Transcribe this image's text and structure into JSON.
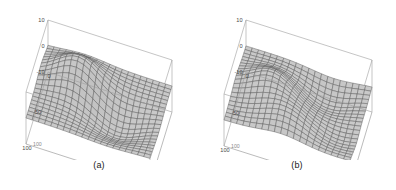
{
  "figure": {
    "background_color": "#ffffff",
    "panel_count": 2
  },
  "panels": [
    {
      "id": "a",
      "caption": "(a)",
      "box_color": "#9a9a9a",
      "mesh_line_color": "#4d4d4d",
      "mesh_fill_color": "#c9c9c9",
      "axes": {
        "z": {
          "ticks": [
            "10",
            "0",
            "-10"
          ],
          "values": [
            10,
            0,
            -10
          ]
        },
        "x": {
          "ticks": [
            "0",
            "50",
            "100"
          ],
          "values": [
            0,
            50,
            100
          ]
        },
        "y": {
          "ticks": [
            "100",
            "50",
            "0"
          ],
          "values": [
            100,
            50,
            0
          ]
        }
      }
    },
    {
      "id": "b",
      "caption": "(b)",
      "box_color": "#9a9a9a",
      "mesh_line_color": "#4d4d4d",
      "mesh_fill_color": "#c9c9c9",
      "axes": {
        "z": {
          "ticks": [
            "10",
            "0",
            "-10"
          ],
          "values": [
            10,
            0,
            -10
          ]
        },
        "x": {
          "ticks": [
            "0",
            "50",
            "100"
          ],
          "values": [
            0,
            50,
            100
          ]
        },
        "y": {
          "ticks": [
            "100",
            "50",
            "0"
          ],
          "values": [
            100,
            50,
            0
          ]
        }
      }
    }
  ],
  "chart_data": [
    {
      "type": "surface",
      "panel": "a",
      "title": "(a)",
      "xlabel": "",
      "ylabel": "",
      "zlabel": "",
      "xlim": [
        0,
        100
      ],
      "ylim": [
        0,
        100
      ],
      "zlim": [
        -10,
        10
      ],
      "xticks": [
        0,
        50,
        100
      ],
      "yticks": [
        0,
        50,
        100
      ],
      "zticks": [
        -10,
        0,
        10
      ],
      "grid": true,
      "legend": "none",
      "mesh_n": 20,
      "description": "Smooth saddle/ridge surface: a raised ridge running across the back-left rising to about +10 and a broad depression toward the front-right dropping to roughly -6, flattening to near 0 at the far edges.",
      "surface_formula": "z = 9*exp(-((x-0.32)^2+(y-0.30)^2)/0.055) - 6.5*exp(-((x-0.62)^2+(y-0.66)^2)/0.07)"
    },
    {
      "type": "surface",
      "panel": "b",
      "title": "(b)",
      "xlabel": "",
      "ylabel": "",
      "zlabel": "",
      "xlim": [
        0,
        100
      ],
      "ylim": [
        0,
        100
      ],
      "zlim": [
        -10,
        10
      ],
      "xticks": [
        0,
        50,
        100
      ],
      "yticks": [
        0,
        50,
        100
      ],
      "zticks": [
        -10,
        0,
        10
      ],
      "grid": true,
      "legend": "none",
      "mesh_n": 20,
      "description": "Broad undulating surface: several gentle mounds peaking near +8 along the back-centre with shallow troughs near -5 toward the front-left, overall flatter and bumpier than panel (a).",
      "surface_formula": "z = 7*exp(-((x-0.45)^2+(y-0.28)^2)/0.05) + 4.5*exp(-((x-0.78)^2+(y-0.45)^2)/0.05) - 5*exp(-((x-0.25)^2+(y-0.70)^2)/0.06) - 3*exp(-((x-0.70)^2+(y-0.85)^2)/0.05)"
    }
  ]
}
